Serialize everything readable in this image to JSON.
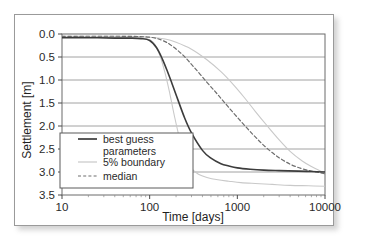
{
  "figure": {
    "frame_border_color": "#9a9a9a",
    "background_color": "#ffffff"
  },
  "chart_data": {
    "type": "line",
    "title": "",
    "xlabel": "Time [days]",
    "ylabel": "Settlement [m]",
    "xscale": "log",
    "xlim": [
      10,
      10000
    ],
    "ylim": [
      0.0,
      3.5
    ],
    "y_inverted": true,
    "grid": true,
    "grid_axis": "y",
    "xticks": [
      10,
      100,
      1000,
      10000
    ],
    "xtick_labels": [
      "10",
      "100",
      "1000",
      "10000"
    ],
    "yticks": [
      0.0,
      0.5,
      1.0,
      1.5,
      2.0,
      2.5,
      3.0,
      3.5
    ],
    "ytick_labels": [
      "0.0",
      "0.5",
      "1.0",
      "1.5",
      "2.0",
      "2.5",
      "3.0",
      "3.5"
    ],
    "legend_position": "lower-left-inside",
    "series": [
      {
        "name": "best guess parameters",
        "style": "solid",
        "color": "#3c3c3c",
        "width": 1.6,
        "x": [
          10,
          20,
          40,
          60,
          80,
          100,
          120,
          140,
          160,
          180,
          200,
          250,
          300,
          400,
          500,
          650,
          800,
          1000,
          1400,
          2000,
          3000,
          5000,
          7000,
          10000
        ],
        "y": [
          0.08,
          0.08,
          0.09,
          0.09,
          0.1,
          0.14,
          0.3,
          0.55,
          0.82,
          1.08,
          1.32,
          1.82,
          2.15,
          2.53,
          2.7,
          2.82,
          2.87,
          2.91,
          2.94,
          2.96,
          2.97,
          2.98,
          2.99,
          3.0
        ]
      },
      {
        "name": "5% boundary",
        "style": "solid",
        "color": "#c9c9c9",
        "width": 1.1,
        "x": [
          10,
          30,
          60,
          90,
          110,
          130,
          150,
          170,
          190,
          220,
          260,
          300,
          360,
          450,
          600,
          800,
          1100,
          1600,
          2500,
          4000,
          6500,
          10000
        ],
        "y": [
          0.07,
          0.07,
          0.08,
          0.1,
          0.18,
          0.45,
          0.85,
          1.3,
          1.75,
          2.28,
          2.72,
          2.92,
          3.05,
          3.12,
          3.17,
          3.2,
          3.23,
          3.25,
          3.27,
          3.29,
          3.3,
          3.31
        ]
      },
      {
        "name": "5% boundary",
        "style": "solid",
        "color": "#c9c9c9",
        "width": 1.1,
        "x": [
          10,
          50,
          100,
          150,
          200,
          300,
          450,
          650,
          900,
          1200,
          1600,
          2200,
          3000,
          4000,
          5500,
          7000,
          8500,
          10000
        ],
        "y": [
          0.05,
          0.05,
          0.07,
          0.11,
          0.18,
          0.33,
          0.56,
          0.82,
          1.1,
          1.38,
          1.68,
          2.0,
          2.3,
          2.55,
          2.76,
          2.88,
          2.96,
          3.02
        ]
      },
      {
        "name": "median",
        "style": "dashed",
        "color": "#6e6e6e",
        "width": 1.2,
        "x": [
          10,
          50,
          100,
          140,
          180,
          240,
          320,
          450,
          600,
          800,
          1100,
          1500,
          2000,
          2800,
          4000,
          5500,
          7000,
          8500,
          10000
        ],
        "y": [
          0.05,
          0.05,
          0.07,
          0.14,
          0.26,
          0.46,
          0.72,
          1.05,
          1.32,
          1.6,
          1.9,
          2.18,
          2.42,
          2.65,
          2.83,
          2.93,
          2.98,
          3.01,
          3.04
        ]
      }
    ]
  },
  "legend": {
    "entries": [
      {
        "label_line1": "best guess",
        "label_line2": "parameters",
        "style": "solid",
        "color": "#3c3c3c"
      },
      {
        "label_line1": "5% boundary",
        "label_line2": "",
        "style": "solid",
        "color": "#c9c9c9"
      },
      {
        "label_line1": "median",
        "label_line2": "",
        "style": "dashed",
        "color": "#6e6e6e"
      }
    ]
  }
}
